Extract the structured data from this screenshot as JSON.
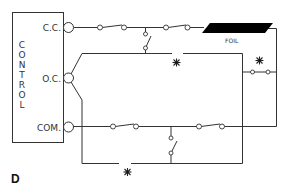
{
  "panel_label": "D",
  "control": {
    "title_letters": [
      "C",
      "O",
      "N",
      "T",
      "R",
      "O",
      "L"
    ],
    "terminals": [
      {
        "id": "cc",
        "label": "C.C."
      },
      {
        "id": "oc",
        "label": "O.C."
      },
      {
        "id": "com",
        "label": "COM."
      }
    ]
  },
  "foil": {
    "label": "FOIL",
    "color": "#000000"
  },
  "markers": {
    "star_symbol": "✳"
  },
  "colors": {
    "line": "#333333",
    "background": "#ffffff"
  }
}
